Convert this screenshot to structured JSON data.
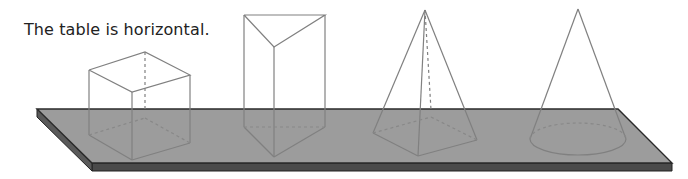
{
  "caption": "The table is horizontal.",
  "figure": {
    "surface": {
      "label": "table",
      "orientation": "horizontal",
      "top_color": "#9a9a9a",
      "edge_color": "#4a4a4a"
    },
    "solids": [
      {
        "name": "cube"
      },
      {
        "name": "triangular prism"
      },
      {
        "name": "square-based pyramid"
      },
      {
        "name": "cone"
      }
    ],
    "line_color": "#777777"
  }
}
